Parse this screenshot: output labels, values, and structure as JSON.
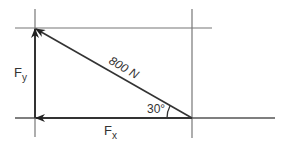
{
  "diagram": {
    "type": "force-vector-decomposition",
    "resultant": {
      "label": "800 N",
      "magnitude": 800,
      "unit": "N"
    },
    "angle": {
      "label": "30°",
      "degrees": 30
    },
    "components": {
      "vertical": {
        "label": "F",
        "subscript": "y"
      },
      "horizontal": {
        "label": "F",
        "subscript": "x"
      }
    },
    "colors": {
      "line": "#555555",
      "arrow": "#222222",
      "guide": "#777777"
    }
  }
}
